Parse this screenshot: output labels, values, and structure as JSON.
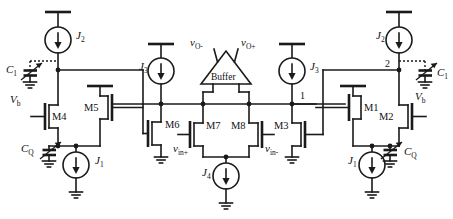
{
  "figure": {
    "type": "circuit-schematic",
    "background": "#ffffff",
    "ink_color": "#1a1a1a"
  },
  "labels": {
    "buffer": "Buffer",
    "v_out_neg": {
      "base": "v",
      "sub": "O-"
    },
    "v_out_pos": {
      "base": "v",
      "sub": "O+"
    },
    "v_in_pos": {
      "base": "v",
      "sub": "in+"
    },
    "v_in_neg": {
      "base": "v",
      "sub": "in-"
    },
    "node_1": "1",
    "node_2": "2"
  },
  "transistors": [
    {
      "id": "M4",
      "label": "M4",
      "side": "left"
    },
    {
      "id": "M5",
      "label": "M5",
      "side": "left"
    },
    {
      "id": "M6",
      "label": "M6",
      "side": "center-left"
    },
    {
      "id": "M7",
      "label": "M7",
      "side": "center"
    },
    {
      "id": "M8",
      "label": "M8",
      "side": "center"
    },
    {
      "id": "M3",
      "label": "M3",
      "side": "center-right"
    },
    {
      "id": "M1",
      "label": "M1",
      "side": "right"
    },
    {
      "id": "M2",
      "label": "M2",
      "side": "right"
    }
  ],
  "sources": [
    {
      "id": "J2L",
      "base": "J",
      "sub": "2",
      "side": "left-top"
    },
    {
      "id": "J1L",
      "base": "J",
      "sub": "1",
      "side": "left-bottom"
    },
    {
      "id": "J3L",
      "base": "J",
      "sub": "3",
      "side": "center-left"
    },
    {
      "id": "J4",
      "base": "J",
      "sub": "4",
      "side": "center-bottom"
    },
    {
      "id": "J3R",
      "base": "J",
      "sub": "3",
      "side": "center-right"
    },
    {
      "id": "J2R",
      "base": "J",
      "sub": "2",
      "side": "right-top"
    },
    {
      "id": "J1R",
      "base": "J",
      "sub": "1",
      "side": "right-bottom"
    }
  ],
  "capacitors": [
    {
      "id": "C1L",
      "base": "C",
      "sub": "1",
      "variable": true,
      "side": "left"
    },
    {
      "id": "CQL",
      "base": "C",
      "sub": "Q",
      "variable": true,
      "side": "left"
    },
    {
      "id": "C1R",
      "base": "C",
      "sub": "1",
      "variable": true,
      "side": "right"
    },
    {
      "id": "CQR",
      "base": "C",
      "sub": "Q",
      "variable": true,
      "side": "right"
    }
  ],
  "bias": [
    {
      "id": "VbL",
      "base": "V",
      "sub": "b",
      "side": "left"
    },
    {
      "id": "VbR",
      "base": "V",
      "sub": "b",
      "side": "right"
    }
  ]
}
